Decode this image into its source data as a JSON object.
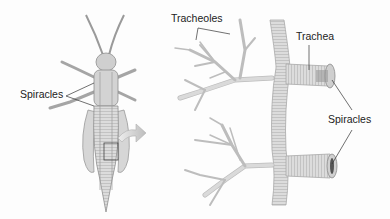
{
  "diagram": {
    "left_panel": {
      "illustration": "grasshopper-dorsal-view",
      "labels": [
        {
          "id": "spiracles-left",
          "text": "Spiracles"
        }
      ]
    },
    "arrow": {
      "direction": "right",
      "meaning": "magnified-detail"
    },
    "right_panel": {
      "illustration": "tracheal-tubes-detail",
      "labels": [
        {
          "id": "tracheoles",
          "text": "Tracheoles"
        },
        {
          "id": "trachea",
          "text": "Trachea"
        },
        {
          "id": "spiracles-right",
          "text": "Spiracles"
        }
      ]
    },
    "colors": {
      "background": "#fdfdfd",
      "tube_fill": "#d9d9d9",
      "tube_stroke": "#a8a8a8",
      "label_text": "#222222",
      "leader_line": "#333333",
      "arrow_fill": "#c8c8c8"
    }
  }
}
